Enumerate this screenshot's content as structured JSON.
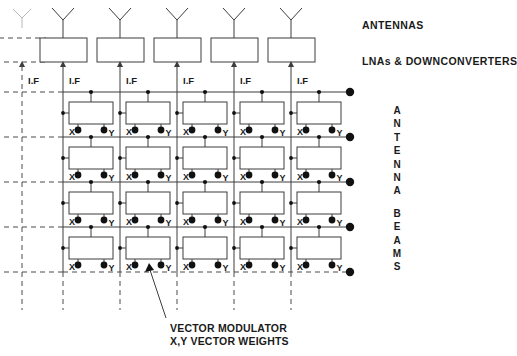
{
  "diagram": {
    "title_hidden": "",
    "labels": {
      "antennas": "ANTENNAS",
      "lnas": "LNAs & DOWNCONVERTERS",
      "vector_modulator_line1": "VECTOR MODULATOR",
      "vector_modulator_line2": "X,Y VECTOR WEIGHTS",
      "if_label": "I.F",
      "x_label": "X",
      "y_label": "Y"
    },
    "vertical_label": {
      "text": "ANTENNA BEAMS",
      "chars": [
        "A",
        "N",
        "T",
        "E",
        "N",
        "N",
        "A",
        "",
        "B",
        "E",
        "A",
        "M",
        "S"
      ]
    },
    "structure": {
      "columns": 6,
      "ghost_column_index": 0,
      "solid_columns": 5,
      "rows_of_modulators": 4,
      "beam_output_dots": 5,
      "column_x": [
        22,
        63,
        120,
        177,
        234,
        291
      ],
      "row_y": [
        92,
        137,
        182,
        227,
        272
      ],
      "antenna_y": 8,
      "lna_box": {
        "y": 38,
        "w": 47,
        "h": 24
      },
      "modulator_box": {
        "w": 44,
        "h": 22
      },
      "output_dot_x": 350
    },
    "colors": {
      "line": "#3c3c3c",
      "dashed": "#4a4a4a",
      "dot": "#111111",
      "text": "#1a1a1a",
      "background": "#ffffff"
    },
    "if_labels": [
      "I.F",
      "I.F",
      "I.F",
      "I.F",
      "I.F",
      "I.F"
    ],
    "cell_port_labels": [
      {
        "x": "X",
        "y": "Y"
      },
      {
        "x": "X",
        "y": "Y"
      },
      {
        "x": "X",
        "y": "Y"
      },
      {
        "x": "X",
        "y": "Y"
      },
      {
        "x": "X",
        "y": "Y"
      },
      {
        "x": "X",
        "y": "Y"
      },
      {
        "x": "X",
        "y": "Y"
      },
      {
        "x": "X",
        "y": "Y"
      },
      {
        "x": "X",
        "y": "Y"
      },
      {
        "x": "X",
        "y": "Y"
      },
      {
        "x": "X",
        "y": "Y"
      },
      {
        "x": "X",
        "y": "Y"
      },
      {
        "x": "X",
        "y": "Y"
      },
      {
        "x": "X",
        "y": "Y"
      },
      {
        "x": "X",
        "y": "Y"
      },
      {
        "x": "X",
        "y": "Y"
      },
      {
        "x": "X",
        "y": "Y"
      },
      {
        "x": "X",
        "y": "Y"
      },
      {
        "x": "X",
        "y": "Y"
      },
      {
        "x": "X",
        "y": "Y"
      }
    ]
  }
}
